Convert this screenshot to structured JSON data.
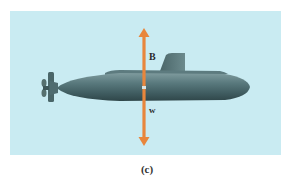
{
  "figure": {
    "caption": "(c)",
    "background_color": "#c9ebf2",
    "forces": [
      {
        "label": "B",
        "direction": "up",
        "color": "#e8863c"
      },
      {
        "label": "w",
        "direction": "down",
        "color": "#e8863c"
      }
    ],
    "hull_color": "#4d6a6e"
  }
}
